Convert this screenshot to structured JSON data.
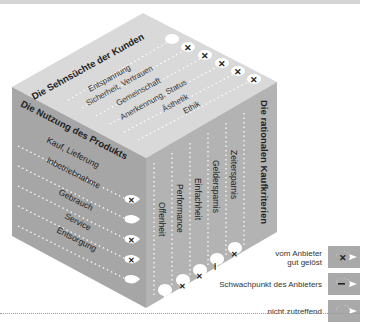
{
  "diagram": {
    "top_face": {
      "title": "Die Sehnsüchte der Kunden",
      "items": [
        "Entspannung",
        "Sicherheit, Vertrauen",
        "Gemeinschaft",
        "Anerkennung, Status",
        "Ästhetik",
        "Ethik"
      ],
      "markers": [
        "none",
        "x",
        "x",
        "x",
        "x",
        "x"
      ]
    },
    "left_face": {
      "title": "Die Nutzung des Produkts",
      "items": [
        "Kauf, Lieferung",
        "Inbetriebnahme",
        "Gebrauch",
        "Service",
        "Entsorgung"
      ],
      "markers": [
        "x",
        "none",
        "x",
        "x",
        "none"
      ]
    },
    "right_face": {
      "title": "Die rationalen Kaufkriterien",
      "items": [
        "Offenheit",
        "Performance",
        "Einfachheit",
        "Geldersparnis",
        "Zeitersparnis"
      ],
      "markers": [
        "none",
        "x",
        "x",
        "minus",
        "x"
      ]
    },
    "colors": {
      "top_face": "#d9d9d9",
      "left_face": "#a6a6a6",
      "right_face": "#b3b3b3",
      "marker_fill": "#ffffff",
      "text": "#222222"
    }
  },
  "legend": {
    "items": [
      {
        "label_line1": "vom Anbieter",
        "label_line2": "gut gelöst",
        "symbol": "x",
        "glyph": "✕"
      },
      {
        "label_line1": "Schwachpunkt des Anbieters",
        "label_line2": "",
        "symbol": "minus",
        "glyph": "–"
      },
      {
        "label_line1": "nicht zutreffend",
        "label_line2": "",
        "symbol": "none",
        "glyph": ""
      }
    ]
  }
}
